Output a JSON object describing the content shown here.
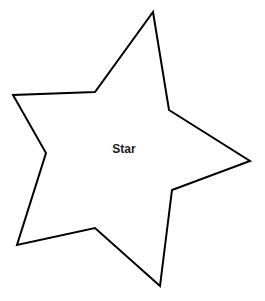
{
  "canvas": {
    "width": 265,
    "height": 301,
    "background_color": "#ffffff"
  },
  "shape": {
    "name": "Star",
    "label": "Star",
    "label_x": 124,
    "label_y": 150,
    "stroke_color": "#000000",
    "fill_color": "#ffffff",
    "stroke_width": 2,
    "points": "153,12 169,110 250,161 172,190 160,286 95,228 17,245 46,153 13,95 95,92",
    "vertices": [
      {
        "role": "outer-tip-top",
        "x": 153,
        "y": 12
      },
      {
        "role": "inner-upper-right",
        "x": 169,
        "y": 110
      },
      {
        "role": "outer-tip-right",
        "x": 250,
        "y": 161
      },
      {
        "role": "inner-lower-right",
        "x": 172,
        "y": 190
      },
      {
        "role": "outer-tip-bottom",
        "x": 160,
        "y": 286
      },
      {
        "role": "inner-lower-left",
        "x": 95,
        "y": 228
      },
      {
        "role": "outer-tip-bottom-left",
        "x": 17,
        "y": 245
      },
      {
        "role": "inner-left",
        "x": 46,
        "y": 153
      },
      {
        "role": "outer-tip-left",
        "x": 13,
        "y": 95
      },
      {
        "role": "inner-upper-left",
        "x": 95,
        "y": 92
      }
    ]
  }
}
